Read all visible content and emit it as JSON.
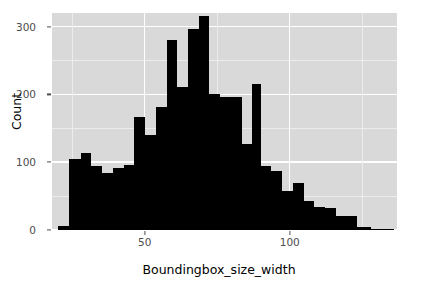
{
  "chart_data": {
    "type": "bar",
    "title": "",
    "subtitle": "",
    "xlabel": "Boundingbox_size_width",
    "ylabel": "Count",
    "xlim": [
      18,
      137
    ],
    "ylim": [
      0,
      320
    ],
    "xticks": [
      50,
      100
    ],
    "yticks": [
      0,
      100,
      200,
      300
    ],
    "grid": true,
    "legend": null,
    "binwidth": 3.7,
    "bin_centers": [
      21.7,
      25.4,
      29.1,
      32.8,
      36.5,
      40.2,
      43.9,
      47.6,
      51.3,
      55.0,
      58.7,
      62.4,
      66.1,
      69.8,
      73.5,
      77.2,
      80.9,
      84.6,
      88.3,
      92.0,
      95.7,
      99.4,
      103.1,
      106.8,
      110.5,
      114.2,
      117.9,
      121.6,
      125.3,
      129.0,
      132.7
    ],
    "values": [
      6,
      104,
      113,
      94,
      84,
      92,
      96,
      166,
      140,
      181,
      280,
      211,
      296,
      315,
      201,
      196,
      196,
      127,
      215,
      95,
      87,
      58,
      70,
      43,
      34,
      33,
      21,
      21,
      4,
      2,
      1
    ],
    "bars": [
      {
        "x0": 20.0,
        "x1": 24.0,
        "value": 6
      },
      {
        "x0": 24.0,
        "x1": 28.0,
        "value": 104
      },
      {
        "x0": 28.0,
        "x1": 31.6,
        "value": 113
      },
      {
        "x0": 31.6,
        "x1": 35.3,
        "value": 94
      },
      {
        "x0": 35.3,
        "x1": 39.0,
        "value": 84
      },
      {
        "x0": 39.0,
        "x1": 42.7,
        "value": 92
      },
      {
        "x0": 42.7,
        "x1": 46.4,
        "value": 96
      },
      {
        "x0": 46.4,
        "x1": 50.1,
        "value": 166
      },
      {
        "x0": 50.1,
        "x1": 53.8,
        "value": 140
      },
      {
        "x0": 53.8,
        "x1": 57.5,
        "value": 181
      },
      {
        "x0": 57.5,
        "x1": 61.2,
        "value": 280
      },
      {
        "x0": 61.2,
        "x1": 64.9,
        "value": 211
      },
      {
        "x0": 64.9,
        "x1": 68.6,
        "value": 296
      },
      {
        "x0": 68.6,
        "x1": 72.3,
        "value": 315
      },
      {
        "x0": 72.3,
        "x1": 76.0,
        "value": 201
      },
      {
        "x0": 76.0,
        "x1": 79.7,
        "value": 196
      },
      {
        "x0": 79.7,
        "x1": 83.4,
        "value": 196
      },
      {
        "x0": 83.4,
        "x1": 87.1,
        "value": 127
      },
      {
        "x0": 87.1,
        "x1": 90.0,
        "value": 215
      },
      {
        "x0": 90.0,
        "x1": 93.7,
        "value": 95
      },
      {
        "x0": 93.7,
        "x1": 97.4,
        "value": 87
      },
      {
        "x0": 97.4,
        "x1": 101.1,
        "value": 58
      },
      {
        "x0": 101.1,
        "x1": 104.8,
        "value": 70
      },
      {
        "x0": 104.8,
        "x1": 108.5,
        "value": 43
      },
      {
        "x0": 108.5,
        "x1": 112.2,
        "value": 34
      },
      {
        "x0": 112.2,
        "x1": 115.9,
        "value": 33
      },
      {
        "x0": 115.9,
        "x1": 119.6,
        "value": 21
      },
      {
        "x0": 119.6,
        "x1": 123.3,
        "value": 21
      },
      {
        "x0": 123.3,
        "x1": 128.0,
        "value": 4
      },
      {
        "x0": 128.0,
        "x1": 132.0,
        "value": 2
      },
      {
        "x0": 132.0,
        "x1": 136.0,
        "value": 1
      }
    ],
    "style": {
      "panel_background": "#d9d9d9",
      "major_gridline": "#ffffff",
      "minor_gridline": "#ececec",
      "bar_color": "#000000",
      "axis_text_color": "#4d4d4d",
      "axis_title_color": "#000000",
      "figure_background": "#ffffff"
    }
  },
  "axes": {
    "x_title": "Boundingbox_size_width",
    "y_title": "Count",
    "x_tick_labels": [
      "50",
      "100"
    ],
    "y_tick_labels": [
      "0",
      "100",
      "200",
      "300"
    ]
  }
}
